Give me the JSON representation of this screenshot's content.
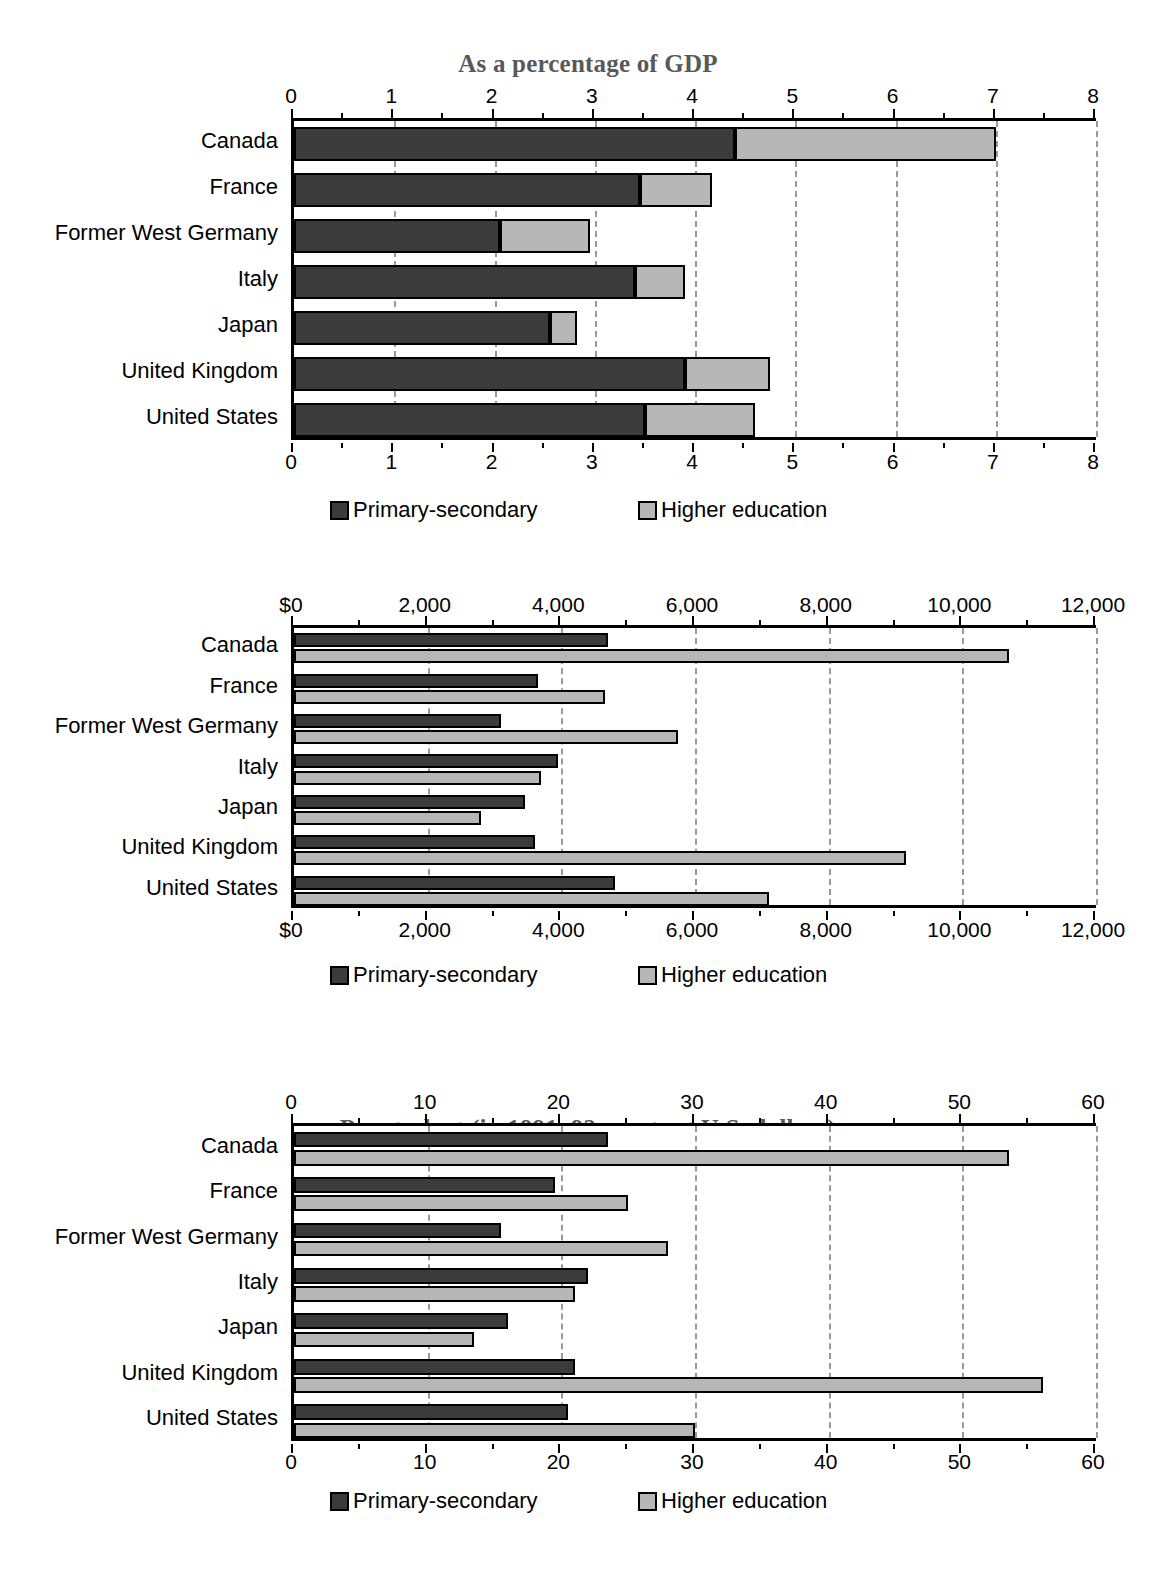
{
  "legend": {
    "primary_label": "Primary-secondary",
    "higher_label": "Higher education",
    "primary_color": "#3b3b3b",
    "higher_color": "#b7b7b7"
  },
  "countries": [
    "Canada",
    "France",
    "Former West Germany",
    "Italy",
    "Japan",
    "United Kingdom",
    "United States"
  ],
  "chart_data": [
    {
      "type": "bar",
      "orientation": "horizontal",
      "stacked": true,
      "title": "As a percentage of GDP",
      "xlabel": "",
      "ylabel": "",
      "xlim": [
        0,
        8
      ],
      "grid": true,
      "legend_position": "bottom",
      "axis_top_ticks": [
        "0",
        "1",
        "2",
        "3",
        "4",
        "5",
        "6",
        "7",
        "8"
      ],
      "axis_bottom_ticks": [
        "0",
        "1",
        "2",
        "3",
        "4",
        "5",
        "6",
        "7",
        "8"
      ],
      "tick_values": [
        0,
        1,
        2,
        3,
        4,
        5,
        6,
        7,
        8
      ],
      "categories": [
        "Canada",
        "France",
        "Former West Germany",
        "Italy",
        "Japan",
        "United Kingdom",
        "United States"
      ],
      "series": [
        {
          "name": "Primary-secondary",
          "values": [
            4.4,
            3.45,
            2.05,
            3.4,
            2.55,
            3.9,
            3.5
          ]
        },
        {
          "name": "Higher education",
          "values": [
            2.6,
            0.72,
            0.9,
            0.5,
            0.27,
            0.85,
            1.1
          ]
        }
      ],
      "totals": [
        7.0,
        4.17,
        2.95,
        3.9,
        2.82,
        4.75,
        4.6
      ]
    },
    {
      "type": "bar",
      "orientation": "horizontal",
      "stacked": false,
      "title": "Per student (in 1991–92 constant U.S. dollars)",
      "xlabel": "",
      "ylabel": "",
      "xlim": [
        0,
        12000
      ],
      "grid": true,
      "legend_position": "bottom",
      "axis_top_ticks": [
        "$0",
        "2,000",
        "4,000",
        "6,000",
        "8,000",
        "10,000",
        "12,000"
      ],
      "axis_bottom_ticks": [
        "$0",
        "2,000",
        "4,000",
        "6,000",
        "8,000",
        "10,000",
        "12,000"
      ],
      "tick_values": [
        0,
        2000,
        4000,
        6000,
        8000,
        10000,
        12000
      ],
      "categories": [
        "Canada",
        "France",
        "Former West Germany",
        "Italy",
        "Japan",
        "United Kingdom",
        "United States"
      ],
      "series": [
        {
          "name": "Primary-secondary",
          "values": [
            4700,
            3650,
            3100,
            3950,
            3450,
            3600,
            4800
          ]
        },
        {
          "name": "Higher education",
          "values": [
            10700,
            4650,
            5750,
            3700,
            2800,
            9150,
            7100
          ]
        }
      ]
    },
    {
      "type": "bar",
      "orientation": "horizontal",
      "stacked": false,
      "title": "Per student as a percentage of GDP per capita",
      "xlabel": "",
      "ylabel": "",
      "xlim": [
        0,
        60
      ],
      "grid": true,
      "legend_position": "bottom",
      "axis_top_ticks": [
        "0",
        "10",
        "20",
        "30",
        "40",
        "50",
        "60"
      ],
      "axis_bottom_ticks": [
        "0",
        "10",
        "20",
        "30",
        "40",
        "50",
        "60"
      ],
      "tick_values": [
        0,
        10,
        20,
        30,
        40,
        50,
        60
      ],
      "categories": [
        "Canada",
        "France",
        "Former West Germany",
        "Italy",
        "Japan",
        "United Kingdom",
        "United States"
      ],
      "series": [
        {
          "name": "Primary-secondary",
          "values": [
            23.5,
            19.5,
            15.5,
            22.0,
            16.0,
            21.0,
            20.5
          ]
        },
        {
          "name": "Higher education",
          "values": [
            53.5,
            25.0,
            28.0,
            21.0,
            13.5,
            56.0,
            30.0
          ]
        }
      ]
    }
  ]
}
